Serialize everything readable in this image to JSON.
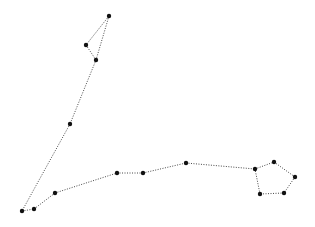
{
  "diagram": {
    "type": "constellation",
    "background": "#ffffff",
    "star_color": "#111111",
    "line_color": "#333333",
    "star_radius": 2.2,
    "stars": [
      {
        "id": "s1",
        "x": 109,
        "y": 16
      },
      {
        "id": "s2",
        "x": 86,
        "y": 45
      },
      {
        "id": "s3",
        "x": 96,
        "y": 60
      },
      {
        "id": "s4",
        "x": 70,
        "y": 124
      },
      {
        "id": "s5",
        "x": 22,
        "y": 211
      },
      {
        "id": "s6",
        "x": 34,
        "y": 209
      },
      {
        "id": "s7",
        "x": 55,
        "y": 193
      },
      {
        "id": "s8",
        "x": 117,
        "y": 173
      },
      {
        "id": "s9",
        "x": 143,
        "y": 173
      },
      {
        "id": "s10",
        "x": 186,
        "y": 163
      },
      {
        "id": "s11",
        "x": 255,
        "y": 169
      },
      {
        "id": "s12",
        "x": 274,
        "y": 162
      },
      {
        "id": "s13",
        "x": 295,
        "y": 177
      },
      {
        "id": "s14",
        "x": 284,
        "y": 193
      },
      {
        "id": "s15",
        "x": 260,
        "y": 194
      }
    ],
    "edges": [
      [
        "s1",
        "s2"
      ],
      [
        "s2",
        "s3"
      ],
      [
        "s1",
        "s3"
      ],
      [
        "s3",
        "s4"
      ],
      [
        "s4",
        "s5"
      ],
      [
        "s5",
        "s6"
      ],
      [
        "s6",
        "s7"
      ],
      [
        "s7",
        "s8"
      ],
      [
        "s8",
        "s9"
      ],
      [
        "s9",
        "s10"
      ],
      [
        "s10",
        "s11"
      ],
      [
        "s11",
        "s12"
      ],
      [
        "s12",
        "s13"
      ],
      [
        "s13",
        "s14"
      ],
      [
        "s14",
        "s15"
      ],
      [
        "s15",
        "s11"
      ]
    ]
  }
}
